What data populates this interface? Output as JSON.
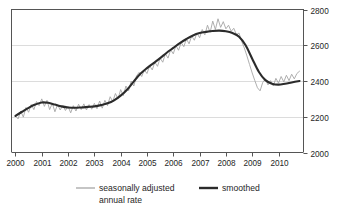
{
  "chart_data": {
    "type": "line",
    "title": "",
    "subtitle": "",
    "xlabel": "",
    "ylabel": "",
    "xlim": [
      1999.85,
      2010.95
    ],
    "ylim": [
      2000,
      2800
    ],
    "ytick_step": 200,
    "yticks": [
      2000,
      2200,
      2400,
      2600,
      2800
    ],
    "ytick_labels": [
      "2000",
      "2200",
      "2400",
      "2600",
      "2800"
    ],
    "yaxis_position": "right",
    "xticks": [
      2000,
      2001,
      2002,
      2003,
      2004,
      2005,
      2006,
      2007,
      2008,
      2009,
      2010
    ],
    "xtick_labels": [
      "2000",
      "2001",
      "2002",
      "2003",
      "2004",
      "2005",
      "2006",
      "2007",
      "2008",
      "2009",
      "2010"
    ],
    "grid": "horizontal",
    "gridlines_at": [
      2200,
      2400,
      2600
    ],
    "legend_position": "below-plot",
    "colors": {
      "raw": "#a6a6a6",
      "smoothed": "#2b2b2b",
      "axis": "#555555",
      "grid": "#dcdcdc",
      "background": "#ffffff"
    },
    "series": [
      {
        "name": "seasonally adjusted annual rate",
        "style": "thin-jagged",
        "color": "#a6a6a6",
        "x": [
          2000.0,
          2000.1,
          2000.2,
          2000.3,
          2000.4,
          2000.5,
          2000.6,
          2000.7,
          2000.8,
          2000.9,
          2001.0,
          2001.1,
          2001.2,
          2001.3,
          2001.4,
          2001.5,
          2001.6,
          2001.7,
          2001.8,
          2001.9,
          2002.0,
          2002.1,
          2002.2,
          2002.3,
          2002.4,
          2002.5,
          2002.6,
          2002.7,
          2002.8,
          2002.9,
          2003.0,
          2003.1,
          2003.2,
          2003.3,
          2003.4,
          2003.5,
          2003.6,
          2003.7,
          2003.8,
          2003.9,
          2004.0,
          2004.1,
          2004.2,
          2004.3,
          2004.4,
          2004.5,
          2004.6,
          2004.7,
          2004.8,
          2004.9,
          2005.0,
          2005.1,
          2005.2,
          2005.3,
          2005.4,
          2005.5,
          2005.6,
          2005.7,
          2005.8,
          2005.9,
          2006.0,
          2006.1,
          2006.2,
          2006.3,
          2006.4,
          2006.5,
          2006.6,
          2006.7,
          2006.8,
          2006.9,
          2007.0,
          2007.1,
          2007.2,
          2007.3,
          2007.4,
          2007.5,
          2007.6,
          2007.7,
          2007.8,
          2007.9,
          2008.0,
          2008.1,
          2008.2,
          2008.3,
          2008.4,
          2008.5,
          2008.6,
          2008.7,
          2008.8,
          2008.9,
          2009.0,
          2009.1,
          2009.2,
          2009.3,
          2009.4,
          2009.5,
          2009.6,
          2009.7,
          2009.8,
          2009.9,
          2010.0,
          2010.1,
          2010.2,
          2010.3,
          2010.4,
          2010.5,
          2010.6,
          2010.7,
          2010.8
        ],
        "y": [
          2205,
          2188,
          2232,
          2198,
          2252,
          2225,
          2268,
          2240,
          2285,
          2262,
          2300,
          2258,
          2292,
          2240,
          2275,
          2228,
          2268,
          2238,
          2262,
          2235,
          2258,
          2222,
          2262,
          2232,
          2270,
          2240,
          2272,
          2238,
          2268,
          2242,
          2275,
          2245,
          2288,
          2248,
          2292,
          2262,
          2312,
          2285,
          2330,
          2300,
          2352,
          2318,
          2372,
          2345,
          2400,
          2372,
          2428,
          2448,
          2425,
          2462,
          2442,
          2485,
          2462,
          2505,
          2482,
          2528,
          2505,
          2552,
          2528,
          2575,
          2552,
          2598,
          2572,
          2615,
          2592,
          2635,
          2608,
          2652,
          2628,
          2668,
          2642,
          2688,
          2658,
          2712,
          2672,
          2735,
          2688,
          2748,
          2700,
          2732,
          2692,
          2712,
          2678,
          2695,
          2660,
          2668,
          2622,
          2585,
          2540,
          2492,
          2445,
          2402,
          2362,
          2345,
          2392,
          2412,
          2378,
          2402,
          2372,
          2415,
          2388,
          2425,
          2395,
          2432,
          2402,
          2438,
          2412,
          2442,
          2455
        ]
      },
      {
        "name": "smoothed",
        "style": "thick-smooth",
        "color": "#2b2b2b",
        "x": [
          2000.0,
          2000.25,
          2000.5,
          2000.75,
          2001.0,
          2001.25,
          2001.5,
          2001.75,
          2002.0,
          2002.25,
          2002.5,
          2002.75,
          2003.0,
          2003.25,
          2003.5,
          2003.75,
          2004.0,
          2004.25,
          2004.5,
          2004.75,
          2005.0,
          2005.25,
          2005.5,
          2005.75,
          2006.0,
          2006.25,
          2006.5,
          2006.75,
          2007.0,
          2007.25,
          2007.5,
          2007.75,
          2008.0,
          2008.25,
          2008.5,
          2008.75,
          2009.0,
          2009.25,
          2009.5,
          2009.75,
          2010.0,
          2010.25,
          2010.5,
          2010.8
        ],
        "y": [
          2205,
          2228,
          2250,
          2268,
          2280,
          2278,
          2268,
          2258,
          2252,
          2250,
          2252,
          2255,
          2258,
          2265,
          2275,
          2292,
          2318,
          2352,
          2398,
          2440,
          2472,
          2500,
          2528,
          2558,
          2585,
          2612,
          2635,
          2655,
          2668,
          2675,
          2680,
          2682,
          2678,
          2668,
          2648,
          2600,
          2525,
          2452,
          2405,
          2385,
          2380,
          2385,
          2392,
          2400
        ]
      }
    ],
    "legend": [
      {
        "label": "seasonally adjusted annual rate",
        "color": "#a6a6a6",
        "weight": "thin"
      },
      {
        "label": "smoothed",
        "color": "#2b2b2b",
        "weight": "thick"
      }
    ]
  },
  "legend_items": {
    "raw_line1": "seasonally adjusted",
    "raw_line2": "annual rate",
    "smoothed": "smoothed"
  },
  "axis": {
    "y_labels": [
      "2800",
      "2600",
      "2400",
      "2200",
      "2000"
    ],
    "x_labels": [
      "2000",
      "2001",
      "2002",
      "2003",
      "2004",
      "2005",
      "2006",
      "2007",
      "2008",
      "2009",
      "2010"
    ]
  }
}
